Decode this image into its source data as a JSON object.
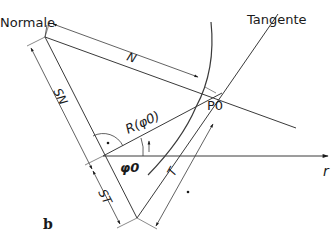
{
  "figure": {
    "panel_label": "b",
    "labels": {
      "normal": "Normale",
      "tangent": "Tangente",
      "n": "N",
      "sn": "SN",
      "st": "ST",
      "t": "T",
      "radius": "R(φ0)",
      "angle": "φ0",
      "point": "P0",
      "axis": "r",
      "right_angle_dot": "·"
    },
    "colors": {
      "line": "#3a3a3a",
      "text": "#1a1a1a",
      "background": "#ffffff"
    }
  }
}
